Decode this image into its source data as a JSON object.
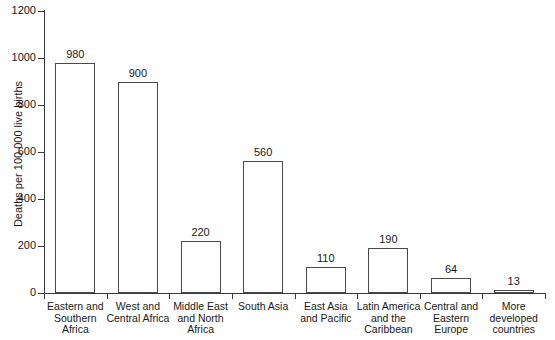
{
  "chart_data": {
    "type": "bar",
    "title": "",
    "subtitle": "",
    "xlabel": "",
    "ylabel": "Deaths per 100 000 live births",
    "ylim": [
      0,
      1200
    ],
    "yticks": [
      0,
      200,
      400,
      600,
      800,
      1000,
      1200
    ],
    "ytick_labels": [
      "0",
      "200",
      "400",
      "600",
      "800",
      "1000",
      "1200"
    ],
    "grid": false,
    "legend": null,
    "bar_style": {
      "fill": "#ffffff",
      "edge": "#4a4a4a",
      "axis": "#3a3a3a",
      "text": "#1a1a1a"
    },
    "categories": [
      "Eastern and Southern Africa",
      "West and Central Africa",
      "Middle East and North Africa",
      "South Asia",
      "East Asia and Pacific",
      "Latin America and the Caribbean",
      "Central and Eastern Europe",
      "More developed countries"
    ],
    "category_label_lines": [
      [
        "Eastern and",
        "Southern",
        "Africa"
      ],
      [
        "West and",
        "Central Africa"
      ],
      [
        "Middle East",
        "and North",
        "Africa"
      ],
      [
        "South Asia"
      ],
      [
        "East Asia",
        "and Pacific"
      ],
      [
        "Latin America",
        "and the",
        "Caribbean"
      ],
      [
        "Central and",
        "Eastern",
        "Europe"
      ],
      [
        "More",
        "developed",
        "countries"
      ]
    ],
    "values": [
      980,
      900,
      220,
      560,
      110,
      190,
      64,
      13
    ],
    "value_labels": [
      "980",
      "900",
      "220",
      "560",
      "110",
      "190",
      "64",
      "13"
    ]
  }
}
